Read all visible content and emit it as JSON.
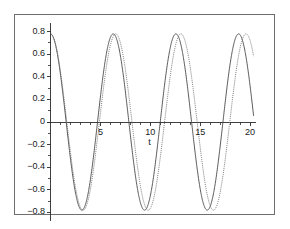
{
  "chart_data": {
    "type": "line",
    "title": "",
    "subtitle": "",
    "xlabel": "t",
    "ylabel": "",
    "xlim": [
      0,
      20.6
    ],
    "ylim": [
      -0.88,
      0.88
    ],
    "grid": false,
    "legend": "none",
    "x_ticks": [
      5,
      10,
      15,
      20
    ],
    "x_tick_labels": [
      "5",
      "10",
      "15",
      "20"
    ],
    "x_minor_ticks": [
      1,
      2,
      3,
      4,
      6,
      7,
      8,
      9,
      11,
      12,
      13,
      14,
      16,
      17,
      18,
      19,
      20
    ],
    "y_ticks": [
      0.8,
      0.6,
      0.4,
      0.2,
      0,
      -0.2,
      -0.4,
      -0.6,
      -0.8
    ],
    "y_tick_labels": [
      "0.8",
      "0.6",
      "0.4",
      "0.2",
      "0",
      "-0.2",
      "-0.4",
      "-0.6",
      "-0.8"
    ],
    "y_minor_ticks": [
      0.7,
      0.5,
      0.3,
      0.1,
      -0.1,
      -0.3,
      -0.5,
      -0.7
    ],
    "series": [
      {
        "name": "curve-1",
        "color": "#3c3c3c",
        "style": "solid",
        "amplitude": 0.78,
        "angular_frequency": 1.0,
        "phase_offset": 0.0,
        "t_start": 0,
        "t_end": 20.35,
        "x": [
          0,
          0.5,
          1,
          1.5,
          2,
          2.5,
          3,
          3.5,
          4,
          4.5,
          5,
          5.5,
          6,
          6.5,
          7,
          7.5,
          8,
          8.5,
          9,
          9.5,
          10,
          10.5,
          11,
          11.5,
          12,
          12.5,
          13,
          13.5,
          14,
          14.5,
          15,
          15.5,
          16,
          16.5,
          17,
          17.5,
          18,
          18.5,
          19,
          19.5,
          20,
          20.35
        ],
        "y": [
          0.78,
          0.685,
          0.421,
          0.055,
          -0.325,
          -0.625,
          -0.772,
          -0.73,
          -0.51,
          -0.165,
          0.221,
          0.548,
          0.749,
          0.78,
          0.588,
          0.274,
          -0.114,
          -0.459,
          -0.71,
          -0.779,
          -0.654,
          -0.374,
          0.004,
          0.359,
          0.653,
          0.772,
          0.69,
          0.446,
          0.086,
          -0.294,
          -0.607,
          -0.769,
          -0.74,
          -0.534,
          -0.197,
          0.19,
          0.528,
          0.741,
          0.78,
          0.604,
          0.299,
          0.31
        ]
      },
      {
        "name": "curve-2",
        "color": "#6b6b6b",
        "style": "dotted",
        "amplitude": 0.78,
        "angular_frequency": 0.962,
        "phase_offset": 0.0,
        "t_start": 0,
        "t_end": 20.35,
        "x": [
          0,
          0.5,
          1,
          1.5,
          2,
          2.5,
          3,
          3.5,
          4,
          4.5,
          5,
          5.5,
          6,
          6.5,
          7,
          7.5,
          8,
          8.5,
          9,
          9.5,
          10,
          10.5,
          11,
          11.5,
          12,
          12.5,
          13,
          13.5,
          14,
          14.5,
          15,
          15.5,
          16,
          16.5,
          17,
          17.5,
          18,
          18.5,
          19,
          19.5,
          20,
          20.35
        ],
        "y": [
          0.78,
          0.698,
          0.452,
          0.1,
          -0.277,
          -0.591,
          -0.76,
          -0.748,
          -0.556,
          -0.227,
          0.16,
          0.504,
          0.73,
          0.78,
          0.639,
          0.35,
          -0.029,
          -0.391,
          -0.672,
          -0.778,
          -0.692,
          -0.44,
          -0.078,
          0.292,
          0.607,
          0.769,
          0.739,
          0.53,
          0.192,
          -0.196,
          -0.533,
          -0.742,
          -0.78,
          -0.636,
          -0.345,
          0.035,
          0.396,
          0.676,
          0.779,
          0.689,
          0.435,
          0.35
        ]
      }
    ],
    "annotations": []
  }
}
